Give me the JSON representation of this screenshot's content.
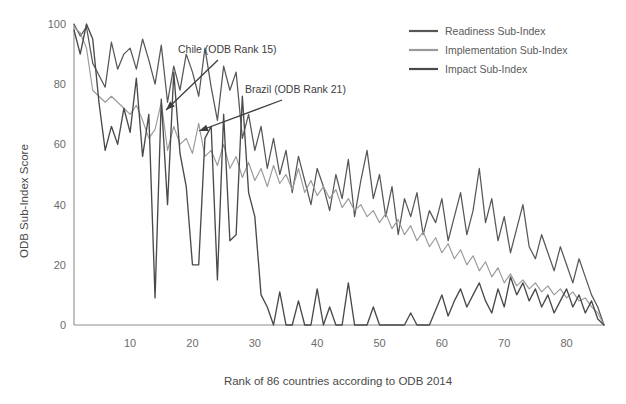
{
  "chart_data": {
    "type": "line",
    "title": "",
    "xlabel": "Rank of 86 countries according to ODB 2014",
    "ylabel": "ODB Sub-Index Score",
    "xlim": [
      1,
      86
    ],
    "ylim": [
      0,
      100
    ],
    "grid": false,
    "legend_position": "top-right",
    "x": [
      1,
      2,
      3,
      4,
      5,
      6,
      7,
      8,
      9,
      10,
      11,
      12,
      13,
      14,
      15,
      16,
      17,
      18,
      19,
      20,
      21,
      22,
      23,
      24,
      25,
      26,
      27,
      28,
      29,
      30,
      31,
      32,
      33,
      34,
      35,
      36,
      37,
      38,
      39,
      40,
      41,
      42,
      43,
      44,
      45,
      46,
      47,
      48,
      49,
      50,
      51,
      52,
      53,
      54,
      55,
      56,
      57,
      58,
      59,
      60,
      61,
      62,
      63,
      64,
      65,
      66,
      67,
      68,
      69,
      70,
      71,
      72,
      73,
      74,
      75,
      76,
      77,
      78,
      79,
      80,
      81,
      82,
      83,
      84,
      85,
      86
    ],
    "xticks": [
      10,
      20,
      30,
      40,
      50,
      60,
      70,
      80
    ],
    "yticks": [
      0,
      20,
      40,
      60,
      80,
      100
    ],
    "series": [
      {
        "name": "Readiness Sub-Index",
        "color": "#575757",
        "width": 1.25,
        "values": [
          100,
          96,
          99,
          87,
          83,
          79,
          94,
          85,
          90,
          92,
          85,
          95,
          88,
          80,
          93,
          74,
          86,
          78,
          90,
          84,
          76,
          92,
          79,
          68,
          86,
          78,
          84,
          62,
          70,
          58,
          66,
          52,
          62,
          50,
          58,
          44,
          56,
          48,
          40,
          52,
          46,
          38,
          50,
          42,
          55,
          36,
          48,
          58,
          42,
          50,
          36,
          46,
          30,
          42,
          36,
          44,
          30,
          38,
          34,
          42,
          28,
          36,
          44,
          30,
          38,
          52,
          34,
          42,
          28,
          36,
          24,
          32,
          40,
          26,
          22,
          30,
          24,
          18,
          26,
          20,
          14,
          22,
          16,
          10,
          6,
          0
        ]
      },
      {
        "name": "Implementation Sub-Index",
        "color": "#9a9a9a",
        "width": 1.15,
        "values": [
          99,
          97,
          92,
          78,
          76,
          74,
          76,
          74,
          72,
          70,
          73,
          68,
          62,
          65,
          74,
          58,
          66,
          60,
          62,
          57,
          67,
          56,
          58,
          53,
          60,
          52,
          56,
          49,
          54,
          48,
          52,
          46,
          53,
          47,
          50,
          45,
          52,
          44,
          48,
          43,
          46,
          42,
          45,
          39,
          42,
          38,
          40,
          36,
          38,
          34,
          37,
          32,
          35,
          30,
          33,
          28,
          31,
          26,
          29,
          24,
          27,
          22,
          25,
          20,
          23,
          18,
          21,
          16,
          19,
          14,
          17,
          13,
          15,
          12,
          14,
          11,
          13,
          10,
          12,
          9,
          11,
          8,
          9,
          6,
          4,
          0
        ]
      },
      {
        "name": "Impact Sub-Index",
        "color": "#4a4a4a",
        "width": 1.35,
        "values": [
          98,
          90,
          100,
          95,
          74,
          58,
          66,
          60,
          72,
          64,
          82,
          56,
          70,
          9,
          75,
          40,
          84,
          57,
          46,
          20,
          20,
          62,
          66,
          15,
          70,
          28,
          30,
          76,
          44,
          36,
          10,
          6,
          0,
          11,
          0,
          0,
          8,
          0,
          0,
          12,
          0,
          6,
          0,
          0,
          14,
          0,
          0,
          0,
          6,
          0,
          0,
          0,
          0,
          0,
          4,
          0,
          0,
          0,
          5,
          10,
          3,
          8,
          12,
          6,
          10,
          14,
          8,
          4,
          12,
          6,
          16,
          10,
          14,
          8,
          12,
          6,
          10,
          4,
          8,
          12,
          6,
          10,
          4,
          8,
          2,
          0
        ]
      }
    ],
    "annotations": [
      {
        "label": "Chile (ODB Rank 15)",
        "text_x": 178,
        "text_y": 53,
        "arrow_from_x": 218,
        "arrow_from_y": 60,
        "arrow_to_x": 166,
        "arrow_to_y": 110
      },
      {
        "label": "Brazil (ODB Rank 21)",
        "text_x": 245,
        "text_y": 93,
        "arrow_from_x": 282,
        "arrow_from_y": 100,
        "arrow_to_x": 199,
        "arrow_to_y": 131
      }
    ]
  }
}
